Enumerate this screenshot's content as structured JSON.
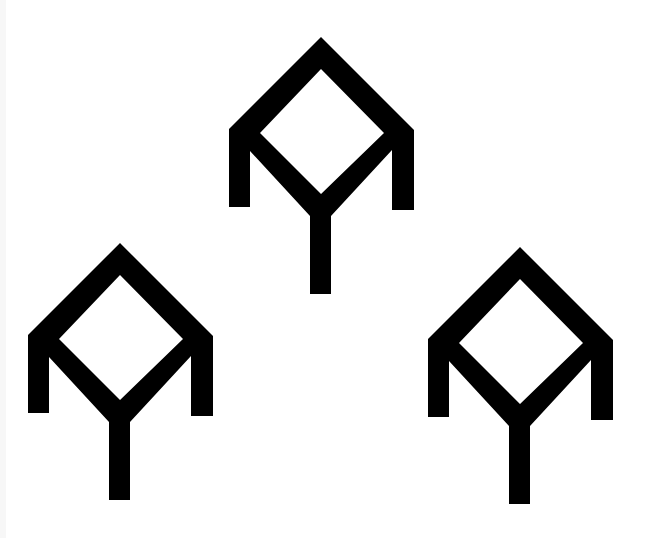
{
  "canvas": {
    "width": 650,
    "height": 538,
    "background": "#ffffff",
    "edge_strip_color": "#f7f7f7"
  },
  "glyph": {
    "name": "diamond-tree-symbol",
    "fill": "#000000",
    "outer_points_relative": [
      [
        0,
        0
      ],
      [
        93,
        93
      ],
      [
        93,
        173
      ],
      [
        71,
        173
      ],
      [
        71,
        113
      ],
      [
        10,
        179
      ],
      [
        10,
        257
      ],
      [
        -11,
        257
      ],
      [
        -11,
        179
      ],
      [
        -71,
        114
      ],
      [
        -71,
        170
      ],
      [
        -92,
        170
      ],
      [
        -92,
        92
      ]
    ],
    "inner_points_relative": [
      [
        0,
        32
      ],
      [
        63,
        96
      ],
      [
        0,
        157
      ],
      [
        -61,
        96
      ]
    ]
  },
  "symbols": [
    {
      "id": "top",
      "apex": [
        321,
        37
      ]
    },
    {
      "id": "left",
      "apex": [
        120,
        243
      ]
    },
    {
      "id": "right",
      "apex": [
        520,
        247
      ]
    }
  ]
}
